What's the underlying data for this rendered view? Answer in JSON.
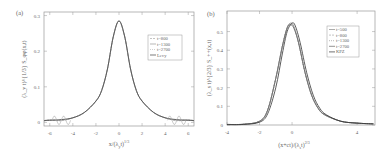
{
  "chart_data": [
    {
      "panel_label": "(a)",
      "type": "line",
      "xlabel": "x/(λ_y t)^{1/3}",
      "ylabel": "(λ_y t)^{1/3} S_{φφ}(x,t)",
      "xlim": [
        -6.5,
        6.5
      ],
      "ylim": [
        -0.01,
        0.31
      ],
      "xticks": [
        -6,
        -4,
        -2,
        0,
        2,
        4,
        6
      ],
      "yticks": [
        0,
        0.1,
        0.2,
        0.3
      ],
      "grid": false,
      "legend_position": "upper right",
      "legend": [
        "t=800",
        "t=1300",
        "t=2700",
        "Levy"
      ],
      "series": [
        {
          "name": "t=800",
          "x": [
            -6.5,
            -6,
            -5,
            -4,
            -3,
            -2,
            -1.5,
            -1,
            -0.5,
            0,
            0.5,
            1,
            1.5,
            2,
            3,
            4,
            5,
            6,
            6.5
          ],
          "y": [
            0.005,
            0.007,
            0.005,
            0.013,
            0.028,
            0.06,
            0.09,
            0.15,
            0.24,
            0.285,
            0.24,
            0.15,
            0.09,
            0.06,
            0.028,
            0.013,
            0.005,
            0.007,
            0.005
          ],
          "note": "oscillates near x=±5"
        },
        {
          "name": "t=1300",
          "x": [
            -6.5,
            -6,
            -5,
            -4,
            -3,
            -2,
            -1.5,
            -1,
            -0.5,
            0,
            0.5,
            1,
            1.5,
            2,
            3,
            4,
            5,
            6,
            6.5
          ],
          "y": [
            0.005,
            0.007,
            0.006,
            0.013,
            0.028,
            0.06,
            0.09,
            0.15,
            0.24,
            0.285,
            0.24,
            0.15,
            0.09,
            0.06,
            0.028,
            0.013,
            0.006,
            0.007,
            0.005
          ]
        },
        {
          "name": "t=2700",
          "x": [
            -6.5,
            -6,
            -5,
            -4,
            -3,
            -2,
            -1.5,
            -1,
            -0.5,
            0,
            0.5,
            1,
            1.5,
            2,
            3,
            4,
            5,
            6,
            6.5
          ],
          "y": [
            0.005,
            0.007,
            0.007,
            0.013,
            0.028,
            0.06,
            0.09,
            0.15,
            0.24,
            0.285,
            0.24,
            0.15,
            0.09,
            0.06,
            0.028,
            0.013,
            0.007,
            0.007,
            0.005
          ]
        },
        {
          "name": "Levy",
          "x": [
            -6.5,
            -6,
            -5,
            -4,
            -3,
            -2,
            -1.5,
            -1,
            -0.5,
            0,
            0.5,
            1,
            1.5,
            2,
            3,
            4,
            5,
            6,
            6.5
          ],
          "y": [
            0.005,
            0.006,
            0.008,
            0.013,
            0.028,
            0.06,
            0.09,
            0.15,
            0.24,
            0.285,
            0.24,
            0.15,
            0.09,
            0.06,
            0.028,
            0.013,
            0.008,
            0.006,
            0.005
          ]
        }
      ]
    },
    {
      "panel_label": "(b)",
      "type": "line",
      "xlabel": "(x+ct)/(λ_s t)^{2/3}",
      "ylabel": "(λ_s t)^{2/3} S_{++}(x,t)",
      "xlim": [
        -4,
        5.1
      ],
      "ylim": [
        0,
        0.61
      ],
      "xticks": [
        -4,
        -2,
        0,
        4
      ],
      "yticks": [
        0,
        0.1,
        0.2,
        0.3,
        0.4,
        0.5
      ],
      "grid": false,
      "legend_position": "upper right",
      "legend": [
        "t=500",
        "t=800",
        "t=1300",
        "t=2700",
        "KPZ"
      ],
      "series": [
        {
          "name": "t=500",
          "x": [
            -4,
            -3,
            -2,
            -1.5,
            -1,
            -0.6,
            -0.3,
            -0.1,
            0.1,
            0.4,
            0.8,
            1.2,
            1.6,
            2,
            3,
            4,
            5
          ],
          "y": [
            0.003,
            0.004,
            0.02,
            0.08,
            0.25,
            0.42,
            0.52,
            0.545,
            0.53,
            0.44,
            0.28,
            0.16,
            0.09,
            0.055,
            0.02,
            0.01,
            0.006
          ]
        },
        {
          "name": "t=800",
          "x": [
            -4,
            -3,
            -2,
            -1.5,
            -1,
            -0.6,
            -0.3,
            -0.1,
            0.1,
            0.4,
            0.8,
            1.2,
            1.6,
            2,
            3,
            4,
            5
          ],
          "y": [
            0.003,
            0.004,
            0.02,
            0.08,
            0.25,
            0.42,
            0.52,
            0.54,
            0.525,
            0.44,
            0.28,
            0.16,
            0.09,
            0.055,
            0.02,
            0.01,
            0.006
          ]
        },
        {
          "name": "t=1300",
          "x": [
            -4,
            -3,
            -2,
            -1.5,
            -1,
            -0.6,
            -0.3,
            -0.1,
            0.1,
            0.4,
            0.8,
            1.2,
            1.6,
            2,
            3,
            4,
            5
          ],
          "y": [
            0.003,
            0.004,
            0.02,
            0.08,
            0.25,
            0.42,
            0.52,
            0.54,
            0.525,
            0.44,
            0.28,
            0.16,
            0.09,
            0.055,
            0.02,
            0.01,
            0.006
          ]
        },
        {
          "name": "t=2700",
          "x": [
            -4,
            -3,
            -2,
            -1.5,
            -1,
            -0.6,
            -0.3,
            -0.1,
            0.1,
            0.4,
            0.8,
            1.2,
            1.6,
            2,
            3,
            4,
            5
          ],
          "y": [
            0.003,
            0.004,
            0.02,
            0.08,
            0.25,
            0.42,
            0.52,
            0.535,
            0.52,
            0.44,
            0.28,
            0.16,
            0.09,
            0.055,
            0.02,
            0.01,
            0.006
          ]
        },
        {
          "name": "KPZ",
          "x": [
            -4,
            -3,
            -2,
            -1.5,
            -1,
            -0.6,
            -0.3,
            0,
            0.2,
            0.5,
            0.9,
            1.3,
            1.7,
            2.1,
            3,
            4,
            5
          ],
          "y": [
            0.002,
            0.003,
            0.015,
            0.06,
            0.2,
            0.38,
            0.5,
            0.545,
            0.53,
            0.44,
            0.28,
            0.16,
            0.09,
            0.055,
            0.02,
            0.01,
            0.006
          ]
        }
      ]
    }
  ],
  "panels": {
    "a": {
      "label": "(a)",
      "xlabel": "x/(λ",
      "xlabel_sub": "y",
      "xlabel_tail": "t)",
      "xlabel_sup": "1/3",
      "ylabel": "(λ_y t)^{1/3} S_φφ(x,t)",
      "xticks": [
        "-6",
        "-4",
        "-2",
        "0",
        "2",
        "4",
        "6"
      ],
      "yticks": [
        "0",
        "0.1",
        "0.2",
        "0.3"
      ],
      "legend": [
        "t=800",
        "t=1300",
        "t=2700",
        "Levy"
      ]
    },
    "b": {
      "label": "(b)",
      "xlabel": "(x+ct)/(λ",
      "xlabel_sub": "s",
      "xlabel_tail": "t)",
      "xlabel_sup": "2/3",
      "ylabel": "(λ_s t)^{2/3} S_++(x,t)",
      "xticks": [
        "-4",
        "-2",
        "0",
        "4"
      ],
      "yticks": [
        "0",
        "0.1",
        "0.2",
        "0.3",
        "0.4",
        "0.5"
      ],
      "legend": [
        "t=500",
        "t=800",
        "t=1300",
        "t=2700",
        "KPZ"
      ]
    }
  }
}
